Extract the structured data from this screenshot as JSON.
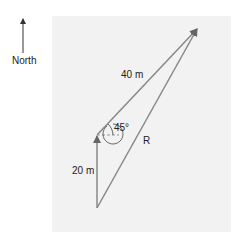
{
  "diagram": {
    "compass_label": "North",
    "vectors": [
      {
        "name": "first-leg",
        "label": "20 m",
        "direction": "north"
      },
      {
        "name": "second-leg",
        "label": "40 m",
        "direction": "45° east of north"
      },
      {
        "name": "resultant",
        "label": "R"
      }
    ],
    "angle_label": "45°",
    "colors": {
      "vector": "#888888",
      "arrowhead": "#666666",
      "background_panel": "#f2f2f2",
      "text": "#222222"
    }
  }
}
